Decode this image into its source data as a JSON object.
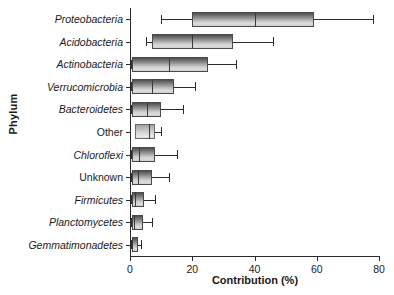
{
  "chart_data": {
    "type": "box",
    "title": "",
    "xlabel": "Contribution (%)",
    "ylabel": "Phylum",
    "xlim": [
      0,
      80
    ],
    "xticks": [
      0,
      20,
      40,
      60,
      80
    ],
    "xtick_labels": [
      "0",
      "20",
      "40",
      "60",
      "80"
    ],
    "grid": false,
    "legend": "none",
    "orientation": "horizontal",
    "categories": [
      "Proteobacteria",
      "Acidobacteria",
      "Actinobacteria",
      "Verrucomicrobia",
      "Bacteroidetes",
      "Other",
      "Chloroflexi",
      "Unknown",
      "Firmicutes",
      "Planctomycetes",
      "Gemmatimonadetes"
    ],
    "boxes": [
      {
        "category": "Proteobacteria",
        "whisker_low": 10.0,
        "q1": 20.0,
        "median": 40.0,
        "q3": 59.0,
        "whisker_high": 78.0,
        "italic": true,
        "shade": "dark"
      },
      {
        "category": "Acidobacteria",
        "whisker_low": 5.0,
        "q1": 7.0,
        "median": 20.0,
        "q3": 33.0,
        "whisker_high": 46.0,
        "italic": true,
        "shade": "dark"
      },
      {
        "category": "Actinobacteria",
        "whisker_low": 0.3,
        "q1": 0.5,
        "median": 12.5,
        "q3": 25.0,
        "whisker_high": 34.0,
        "italic": true,
        "shade": "dark"
      },
      {
        "category": "Verrucomicrobia",
        "whisker_low": 0.3,
        "q1": 0.5,
        "median": 7.0,
        "q3": 14.0,
        "whisker_high": 21.0,
        "italic": true,
        "shade": "dark"
      },
      {
        "category": "Bacteroidetes",
        "whisker_low": 0.3,
        "q1": 0.5,
        "median": 5.5,
        "q3": 10.0,
        "whisker_high": 17.0,
        "italic": true,
        "shade": "dark"
      },
      {
        "category": "Other",
        "whisker_low": 1.5,
        "q1": 1.7,
        "median": 6.0,
        "q3": 8.0,
        "whisker_high": 10.0,
        "italic": false,
        "shade": "light"
      },
      {
        "category": "Chloroflexi",
        "whisker_low": 0.3,
        "q1": 0.5,
        "median": 3.0,
        "q3": 8.0,
        "whisker_high": 15.0,
        "italic": true,
        "shade": "dark"
      },
      {
        "category": "Unknown",
        "whisker_low": 0.3,
        "q1": 0.5,
        "median": 2.5,
        "q3": 7.0,
        "whisker_high": 12.5,
        "italic": false,
        "shade": "dark"
      },
      {
        "category": "Firmicutes",
        "whisker_low": 0.3,
        "q1": 0.5,
        "median": 1.7,
        "q3": 4.5,
        "whisker_high": 8.0,
        "italic": true,
        "shade": "dark"
      },
      {
        "category": "Planctomycetes",
        "whisker_low": 0.3,
        "q1": 0.5,
        "median": 1.4,
        "q3": 4.3,
        "whisker_high": 7.0,
        "italic": true,
        "shade": "dark"
      },
      {
        "category": "Gemmatimonadetes",
        "whisker_low": 0.3,
        "q1": 0.5,
        "median": 0.7,
        "q3": 2.5,
        "whisker_high": 3.5,
        "italic": true,
        "shade": "dark"
      }
    ]
  }
}
